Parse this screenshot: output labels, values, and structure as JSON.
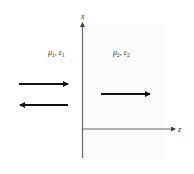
{
  "diagram": {
    "type": "interface-wave-diagram",
    "axes": {
      "vertical_label": "x",
      "horizontal_label": "z"
    },
    "regions": [
      {
        "name": "medium-1",
        "label_mu": "μ",
        "label_mu_sub": "1",
        "label_eps": "ε",
        "label_eps_sub": "1",
        "shaded": false
      },
      {
        "name": "medium-2",
        "label_mu": "μ",
        "label_mu_sub": "2",
        "label_eps": "ε",
        "label_eps_sub": "2",
        "shaded": true
      }
    ],
    "arrows": [
      {
        "name": "incident-wave",
        "direction": "right",
        "region": "medium-1"
      },
      {
        "name": "reflected-wave",
        "direction": "left",
        "region": "medium-1"
      },
      {
        "name": "transmitted-wave",
        "direction": "right",
        "region": "medium-2"
      }
    ],
    "colors": {
      "shade_dots": "#b8b8b8",
      "axis": "#555555",
      "arrow": "#111111"
    }
  }
}
